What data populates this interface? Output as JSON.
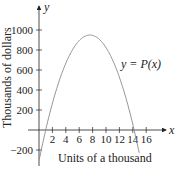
{
  "chart_data": {
    "type": "line",
    "title": "",
    "xlabel": "Units of a thousand",
    "ylabel": "Thousands of dollars",
    "x_axis_name": "x",
    "y_axis_name": "y",
    "curve_label": "y = P(x)",
    "xlim": [
      -1,
      17
    ],
    "ylim": [
      -300,
      1150
    ],
    "x_ticks": [
      2,
      4,
      6,
      8,
      10,
      12,
      14,
      16
    ],
    "y_ticks": [
      -200,
      200,
      400,
      600,
      800,
      1000
    ],
    "x_tick_labels": [
      "2",
      "4",
      "6",
      "8",
      "10",
      "12",
      "14",
      "16"
    ],
    "y_tick_labels": [
      "−200",
      "200",
      "400",
      "600",
      "800",
      "1000"
    ],
    "grid": false,
    "series": [
      {
        "name": "P(x)",
        "color": "#888888",
        "x": [
          0,
          1,
          2,
          3,
          4,
          5,
          6,
          7,
          7.6,
          8,
          9,
          10,
          11,
          12,
          13,
          14,
          14.2,
          15
        ],
        "values": [
          -310,
          0,
          263,
          482,
          657,
          788,
          876,
          919,
          950,
          945,
          919,
          876,
          788,
          657,
          482,
          263,
          0,
          -310
        ]
      }
    ]
  }
}
